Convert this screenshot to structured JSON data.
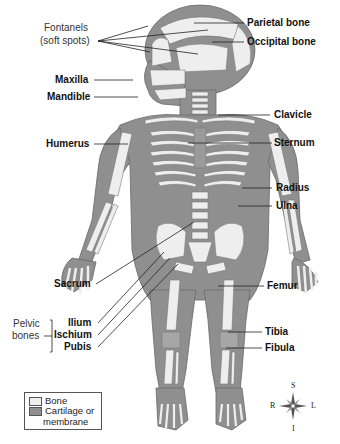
{
  "figure": {
    "colors": {
      "bone": "#eeeeee",
      "cartilage": "#8f8f8f",
      "outline": "#6a6a6a",
      "leader": "#222222"
    }
  },
  "labels": {
    "fontanels_line1": "Fontanels",
    "fontanels_line2": "(soft spots)",
    "parietal": "Parietal bone",
    "occipital": "Occipital bone",
    "maxilla": "Maxilla",
    "mandible": "Mandible",
    "clavicle": "Clavicle",
    "humerus": "Humerus",
    "sternum": "Sternum",
    "radius": "Radius",
    "ulna": "Ulna",
    "sacrum": "Sacrum",
    "femur": "Femur",
    "pelvic_line1": "Pelvic",
    "pelvic_line2": "bones",
    "ilium": "Ilium",
    "ischium": "Ischium",
    "pubis": "Pubis",
    "tibia": "Tibia",
    "fibula": "Fibula"
  },
  "legend": {
    "items": [
      {
        "label": "Bone",
        "color": "#eeeeee"
      },
      {
        "label": "Cartilage or",
        "label2": "membrane",
        "color": "#8f8f8f"
      }
    ]
  },
  "compass": {
    "top": "S",
    "bottom": "I",
    "left": "R",
    "right": "L"
  }
}
